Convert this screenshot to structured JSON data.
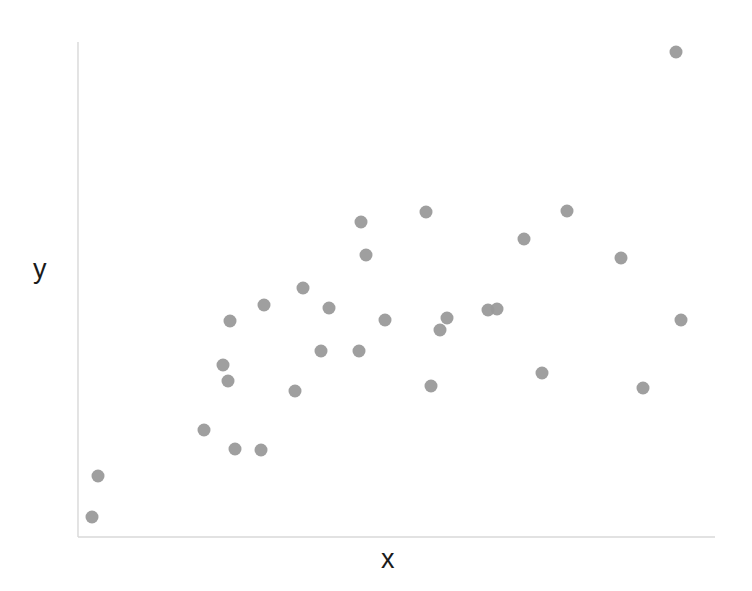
{
  "figure": {
    "background_color": "#ffffff",
    "width": 752,
    "height": 591
  },
  "axes": {
    "line_color": "#d8d8d8",
    "x_axis": {
      "x_start": 78,
      "x_end": 715,
      "y": 537
    },
    "y_axis": {
      "x": 78,
      "y_start": 42,
      "y_end": 537
    },
    "ticks_visible": false,
    "tick_labels_visible": false,
    "grid_visible": false
  },
  "marker_style": {
    "shape": "circle",
    "color": "#9a9a9a",
    "radius_px": 6.5,
    "count": 30
  },
  "chart_data": {
    "type": "scatter",
    "title": "",
    "xlabel": "x",
    "ylabel": "y",
    "grid": false,
    "legend": false,
    "xlim": [
      0,
      1
    ],
    "ylim": [
      0,
      1
    ],
    "n_points": 30,
    "points_px": [
      {
        "x": 92,
        "y": 517
      },
      {
        "x": 98,
        "y": 476
      },
      {
        "x": 204,
        "y": 430
      },
      {
        "x": 223,
        "y": 365
      },
      {
        "x": 228,
        "y": 381
      },
      {
        "x": 230,
        "y": 321
      },
      {
        "x": 235,
        "y": 449
      },
      {
        "x": 261,
        "y": 450
      },
      {
        "x": 264,
        "y": 305
      },
      {
        "x": 295,
        "y": 391
      },
      {
        "x": 303,
        "y": 288
      },
      {
        "x": 321,
        "y": 351
      },
      {
        "x": 329,
        "y": 308
      },
      {
        "x": 359,
        "y": 351
      },
      {
        "x": 361,
        "y": 222
      },
      {
        "x": 385,
        "y": 320
      },
      {
        "x": 426,
        "y": 212
      },
      {
        "x": 431,
        "y": 386
      },
      {
        "x": 440,
        "y": 330
      },
      {
        "x": 447,
        "y": 318
      },
      {
        "x": 488,
        "y": 310
      },
      {
        "x": 524,
        "y": 239
      },
      {
        "x": 542,
        "y": 373
      },
      {
        "x": 567,
        "y": 211
      },
      {
        "x": 621,
        "y": 258
      },
      {
        "x": 643,
        "y": 388
      },
      {
        "x": 676,
        "y": 52
      },
      {
        "x": 681,
        "y": 320
      },
      {
        "x": 497,
        "y": 309
      },
      {
        "x": 366,
        "y": 255
      }
    ],
    "x": [
      0.022,
      0.032,
      0.198,
      0.228,
      0.235,
      0.239,
      0.246,
      0.287,
      0.292,
      0.341,
      0.353,
      0.381,
      0.394,
      0.441,
      0.444,
      0.482,
      0.546,
      0.554,
      0.568,
      0.579,
      0.643,
      0.7,
      0.728,
      0.767,
      0.852,
      0.887,
      0.939,
      0.946,
      0.658,
      0.452
    ],
    "y": [
      0.04,
      0.123,
      0.216,
      0.347,
      0.315,
      0.436,
      0.178,
      0.176,
      0.469,
      0.295,
      0.503,
      0.376,
      0.462,
      0.376,
      0.636,
      0.438,
      0.657,
      0.305,
      0.418,
      0.442,
      0.459,
      0.602,
      0.331,
      0.659,
      0.564,
      0.301,
      0.98,
      0.438,
      0.46,
      0.57
    ]
  },
  "labels": {
    "y": "y",
    "x": "x"
  }
}
